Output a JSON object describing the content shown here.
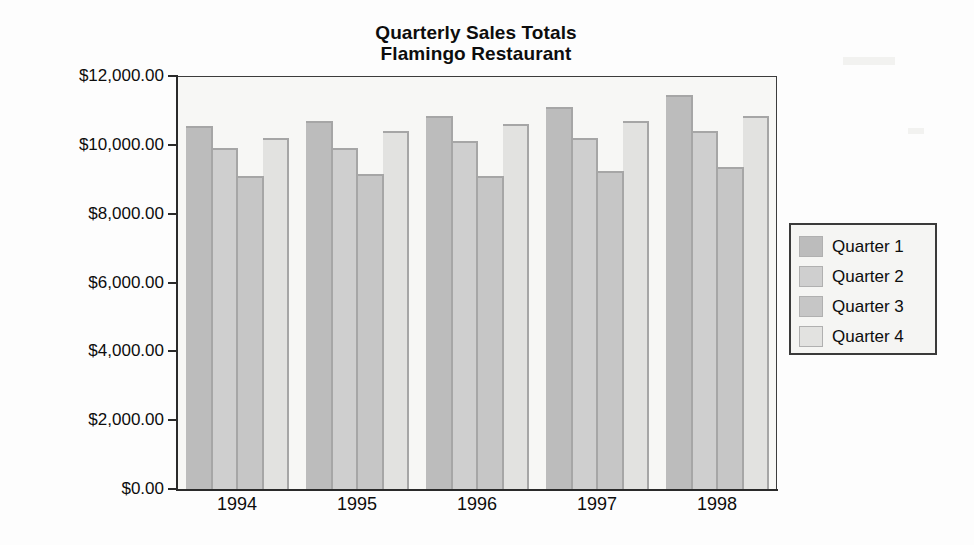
{
  "chart_data": {
    "type": "bar",
    "title": "Quarterly Sales Totals",
    "subtitle": "Flamingo Restaurant",
    "title_lines": [
      "Quarterly Sales Totals",
      "Flamingo Restaurant"
    ],
    "xlabel": "",
    "ylabel": "",
    "categories": [
      "1994",
      "1995",
      "1996",
      "1997",
      "1998"
    ],
    "ylim": [
      0,
      12000
    ],
    "ytick_values": [
      0,
      2000,
      4000,
      6000,
      8000,
      10000,
      12000
    ],
    "ytick_labels": [
      "$0.00",
      "$2,000.00",
      "$4,000.00",
      "$6,000.00",
      "$8,000.00",
      "$10,000.00",
      "$12,000.00"
    ],
    "grid": false,
    "legend_position": "right",
    "series": [
      {
        "name": "Quarter 1",
        "color": "#bcbcbc",
        "values": [
          10550,
          10700,
          10850,
          11100,
          11450
        ]
      },
      {
        "name": "Quarter 2",
        "color": "#cfcfcf",
        "values": [
          9900,
          9900,
          10100,
          10200,
          10400
        ]
      },
      {
        "name": "Quarter 3",
        "color": "#c6c6c6",
        "values": [
          9100,
          9150,
          9100,
          9250,
          9350
        ]
      },
      {
        "name": "Quarter 4",
        "color": "#e2e2e0",
        "values": [
          10200,
          10400,
          10600,
          10700,
          10850
        ]
      }
    ]
  },
  "legend": {
    "items": [
      {
        "label": "Quarter 1",
        "color": "#bcbcbc"
      },
      {
        "label": "Quarter 2",
        "color": "#cfcfcf"
      },
      {
        "label": "Quarter 3",
        "color": "#c6c6c6"
      },
      {
        "label": "Quarter 4",
        "color": "#e2e2e0"
      }
    ]
  },
  "colors": {
    "axis": "#2a2a2a",
    "plot_background": "#f7f7f5",
    "page_background": "#ffffff",
    "bar_outline": "#a6a6a6",
    "legend_border": "#3a3a3a"
  }
}
